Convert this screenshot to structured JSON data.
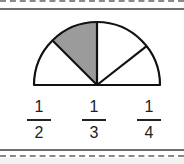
{
  "figure": {
    "shape": "semicircle",
    "sectors": 4,
    "shaded_sector_index": 1,
    "colors": {
      "stroke": "#111111",
      "shade": "#9b9b9b",
      "background": "#ffffff"
    }
  },
  "options": [
    {
      "numerator": "1",
      "denominator": "2"
    },
    {
      "numerator": "1",
      "denominator": "3"
    },
    {
      "numerator": "1",
      "denominator": "4"
    }
  ]
}
